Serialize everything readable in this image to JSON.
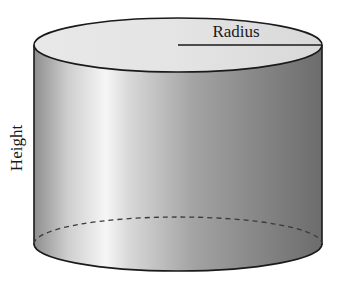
{
  "diagram": {
    "type": "cylinder",
    "labels": {
      "radius": "Radius",
      "height": "Height"
    },
    "geometry": {
      "center_x": 178,
      "radius_x": 144,
      "top_y": 45,
      "bottom_y": 244,
      "radius_y": 27
    },
    "colors": {
      "top_face": "#e2e2e2",
      "side_left": "#8e8e8e",
      "side_highlight": "#f6f6f6",
      "side_mid": "#9a9a9a",
      "side_right": "#6c6c6c",
      "outline": "#1a1a1a",
      "hidden_edge": "#3a3a3a"
    }
  }
}
